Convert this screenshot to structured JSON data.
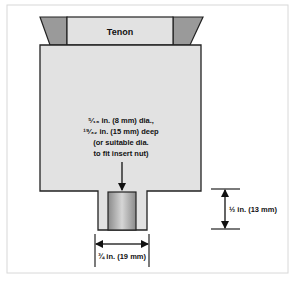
{
  "diagram": {
    "tenon_label": "Tenon",
    "hole_note": {
      "line1": "⁵⁄₁₆ in. (8 mm) dia.,",
      "line2": "¹⁹⁄₃₂ in. (15 mm) deep",
      "line3": "(or suitable dia.",
      "line4": "to fit insert nut)"
    },
    "dim_height": "½ in. (13 mm)",
    "dim_width": "¾ in. (19 mm)"
  },
  "colors": {
    "body_fill": "#e2e2e2",
    "wedge_fill": "#9a9a9a",
    "outline": "#222222",
    "insert_light": "#d6d6d6",
    "insert_dark": "#8a8a8a",
    "frame": "#d8d8d8"
  }
}
